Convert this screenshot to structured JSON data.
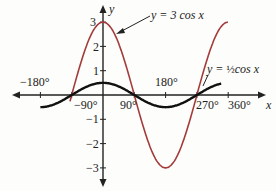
{
  "chart_data": {
    "type": "line",
    "title": "",
    "xlabel": "x",
    "ylabel": "y",
    "x_ticks": [
      "-180°",
      "-90°",
      "90°",
      "180°",
      "270°",
      "360°"
    ],
    "y_ticks": [
      "3",
      "2",
      "1",
      "-1",
      "-2",
      "-3"
    ],
    "xlim": [
      -180,
      360
    ],
    "ylim": [
      -3,
      3
    ],
    "grid": false,
    "series": [
      {
        "name": "y = 3 cos x",
        "function": "3*cos(x)",
        "domain": [
          -95,
          360
        ],
        "color": "#a33b3b",
        "x": [
          -90,
          0,
          90,
          180,
          270,
          360
        ],
        "values": [
          0,
          3,
          0,
          -3,
          0,
          3
        ]
      },
      {
        "name": "y = 1/2 cos x",
        "function": "0.5*cos(x)",
        "domain": [
          -180,
          340
        ],
        "color": "#111111",
        "x": [
          -180,
          -90,
          0,
          90,
          180,
          270
        ],
        "values": [
          -0.5,
          0,
          0.5,
          0,
          -0.5,
          0
        ]
      }
    ],
    "annotations": [
      "y = 3 cos x",
      "y = ½cos x"
    ]
  },
  "labels": {
    "x_axis": "x",
    "y_axis": "y",
    "ann_big": "y = 3 cos x",
    "ann_small_pre": "y = ",
    "ann_small_frac": "½",
    "ann_small_post": "cos x",
    "t_m180": "−180°",
    "t_m90": "−90°",
    "t_90": "90°",
    "t_180": "180°",
    "t_270": "270°",
    "t_360": "360°",
    "y3": "3",
    "y2": "2",
    "y1": "1",
    "ym1": "−1",
    "ym2": "−2",
    "ym3": "−3"
  }
}
